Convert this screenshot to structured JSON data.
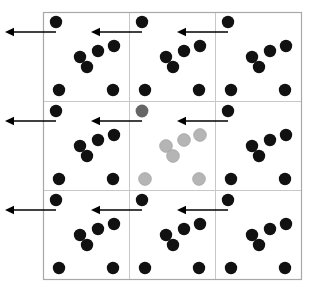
{
  "figure": {
    "width": 313,
    "height": 294,
    "background_color": "#ffffff"
  },
  "colors": {
    "particle_black": "#111111",
    "particle_gray_dark": "#666666",
    "particle_gray_light": "#b5b5b5",
    "cell_border": "#c8c8c8",
    "frame_border": "#a0a0a0",
    "arrow": "#000000"
  },
  "grid": {
    "rows": 3,
    "columns": 3,
    "origin_x": 43,
    "origin_y": 12,
    "cell_width": 86,
    "cell_height": 89,
    "label": "3 by 3 tiling of periodic image cells"
  },
  "particle_style": {
    "radius": 6.2,
    "gray_radius": 6.4
  },
  "cell_pattern": {
    "description": "Each periodic image cell contains the same seven particles at identical relative offsets",
    "count": 7,
    "offsets": [
      {
        "id": "p1",
        "x": 13,
        "y": 10
      },
      {
        "id": "p2",
        "x": 37,
        "y": 45
      },
      {
        "id": "p3",
        "x": 55,
        "y": 39
      },
      {
        "id": "p4",
        "x": 44,
        "y": 55
      },
      {
        "id": "p5",
        "x": 71,
        "y": 34
      },
      {
        "id": "p6",
        "x": 16,
        "y": 78
      },
      {
        "id": "p7",
        "x": 70,
        "y": 78
      }
    ]
  },
  "cells": [
    {
      "row": 0,
      "col": 0,
      "name": "cell-top-left",
      "kind": "image",
      "color_key": "particle_black"
    },
    {
      "row": 0,
      "col": 1,
      "name": "cell-top-center",
      "kind": "image",
      "color_key": "particle_black"
    },
    {
      "row": 0,
      "col": 2,
      "name": "cell-top-right",
      "kind": "image",
      "color_key": "particle_black"
    },
    {
      "row": 1,
      "col": 0,
      "name": "cell-middle-left",
      "kind": "image",
      "color_key": "particle_black"
    },
    {
      "row": 1,
      "col": 1,
      "name": "cell-center-primary",
      "kind": "primary",
      "color_key": "particle_gray_light"
    },
    {
      "row": 1,
      "col": 2,
      "name": "cell-middle-right",
      "kind": "image",
      "color_key": "particle_black"
    },
    {
      "row": 2,
      "col": 0,
      "name": "cell-bottom-left",
      "kind": "image",
      "color_key": "particle_black"
    },
    {
      "row": 2,
      "col": 1,
      "name": "cell-bottom-center",
      "kind": "image",
      "color_key": "particle_black"
    },
    {
      "row": 2,
      "col": 2,
      "name": "cell-bottom-right",
      "kind": "image",
      "color_key": "particle_black"
    }
  ],
  "center_cell_overrides": {
    "description": "In the primary center cell the first particle is dark gray and the remaining six are light gray",
    "p1": "particle_gray_dark",
    "p2": "particle_gray_light",
    "p3": "particle_gray_light",
    "p4": "particle_gray_light",
    "p5": "particle_gray_light",
    "p6": "particle_gray_light",
    "p7": "particle_gray_light"
  },
  "arrows": [
    {
      "name": "arrow-row1-col1",
      "row": 0,
      "col": 0,
      "x_start": 56,
      "x_end": 5,
      "y": 32
    },
    {
      "name": "arrow-row1-col2",
      "row": 0,
      "col": 1,
      "x_start": 142,
      "x_end": 91,
      "y": 32
    },
    {
      "name": "arrow-row1-col3",
      "row": 0,
      "col": 2,
      "x_start": 228,
      "x_end": 177,
      "y": 32
    },
    {
      "name": "arrow-row2-col1",
      "row": 1,
      "col": 0,
      "x_start": 56,
      "x_end": 5,
      "y": 121
    },
    {
      "name": "arrow-row2-col2",
      "row": 1,
      "col": 1,
      "x_start": 142,
      "x_end": 91,
      "y": 121
    },
    {
      "name": "arrow-row2-col3",
      "row": 1,
      "col": 2,
      "x_start": 228,
      "x_end": 177,
      "y": 121
    },
    {
      "name": "arrow-row3-col1",
      "row": 2,
      "col": 0,
      "x_start": 56,
      "x_end": 5,
      "y": 210
    },
    {
      "name": "arrow-row3-col2",
      "row": 2,
      "col": 1,
      "x_start": 142,
      "x_end": 91,
      "y": 210
    },
    {
      "name": "arrow-row3-col3",
      "row": 2,
      "col": 2,
      "x_start": 228,
      "x_end": 177,
      "y": 210
    }
  ],
  "arrow_style": {
    "line_width": 1.6,
    "head_length": 9,
    "head_half_width": 4.2,
    "direction": "left",
    "meaning": "velocity vector of the leading particle, pointing in the negative x direction"
  }
}
